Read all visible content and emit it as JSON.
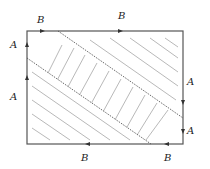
{
  "diagram": {
    "colors": {
      "frame": "#555555",
      "hatch": "#b0b0b0",
      "dotted": "#333333",
      "text": "#222222"
    },
    "labels": {
      "top_left_B": "B",
      "top_right_B": "B",
      "left_upper_A": "A",
      "left_lower_A": "A",
      "right_upper_A": "A",
      "right_lower_A": "A",
      "bottom_left_B": "B",
      "bottom_right_B": "B"
    },
    "regions": [
      {
        "name": "top-right-corner",
        "hatch": "backslash"
      },
      {
        "name": "middle-strip",
        "hatch": "slash"
      },
      {
        "name": "bottom-left-corner",
        "hatch": "backslash"
      }
    ]
  }
}
